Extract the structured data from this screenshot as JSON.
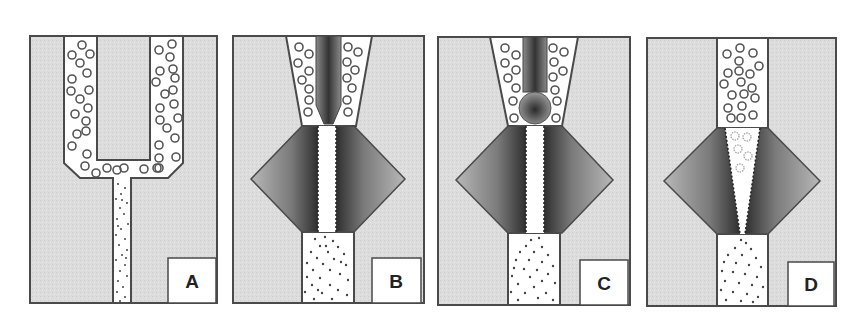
{
  "figure": {
    "colors": {
      "body_fill": "#dedede",
      "body_stroke": "#4a4a4a",
      "channel_fill": "#ffffff",
      "diamond_dark": "#3a3a3a",
      "diamond_light": "#b4b4b4",
      "droplet_stroke": "#555555",
      "particle": "#444444",
      "label_box": "#ffffff"
    },
    "panels": [
      {
        "id": "A",
        "label": "A"
      },
      {
        "id": "B",
        "label": "B"
      },
      {
        "id": "C",
        "label": "C"
      },
      {
        "id": "D",
        "label": "D"
      }
    ]
  }
}
